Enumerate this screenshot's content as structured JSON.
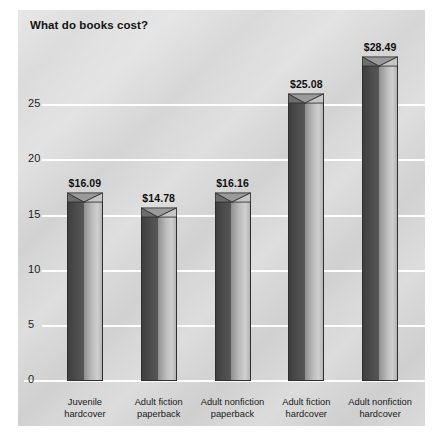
{
  "chart_data": {
    "type": "bar",
    "title": "What do books cost?",
    "xlabel": "",
    "ylabel": "",
    "ylim": [
      0,
      30
    ],
    "yticks": [
      0,
      5,
      10,
      15,
      20,
      25
    ],
    "ytick_labels": [
      "0",
      "5",
      "10",
      "15",
      "20",
      "25"
    ],
    "grid": true,
    "legend": "none",
    "categories": [
      "Juvenile hardcover",
      "Adult fiction paperback",
      "Adult nonfiction paperback",
      "Adult fiction hardcover",
      "Adult nonfiction hardcover"
    ],
    "category_lines": [
      [
        "Juvenile",
        "hardcover"
      ],
      [
        "Adult fiction",
        "paperback"
      ],
      [
        "Adult nonfiction",
        "paperback"
      ],
      [
        "Adult fiction",
        "hardcover"
      ],
      [
        "Adult nonfiction",
        "hardcover"
      ]
    ],
    "values": [
      16.09,
      14.78,
      16.16,
      25.08,
      28.49
    ],
    "data_labels": [
      "$16.09",
      "$14.78",
      "$16.16",
      "$25.08",
      "$28.49"
    ],
    "colors": {
      "bar_dark_face": "#4a4a4a",
      "bar_light_face": "#bcbcbc",
      "bar_outline": "#2e2e2e",
      "panel_background": "#d9d9d9",
      "gridline": "#ffffff",
      "text": "#121212"
    }
  }
}
